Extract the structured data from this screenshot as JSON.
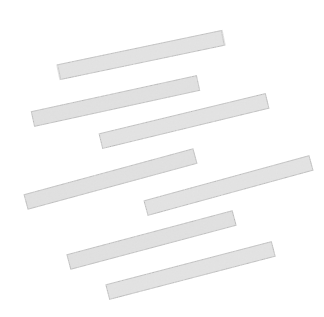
{
  "figure": {
    "title": "",
    "canvas": {
      "width": 324,
      "height": 317,
      "background": "#ffffff"
    },
    "style": {
      "fill_color": "#e9e9e9",
      "stroke_color": "#4a4a4a",
      "stroke_width": 1,
      "texture": "speckled-noise",
      "texture_color": "#b9b9b9",
      "shape_kind": "elongated-rectangle"
    },
    "object_count_label": "7",
    "bars": [
      {
        "id": "bar-1",
        "label": "1",
        "left_end": {
          "x": 59,
          "y": 72
        },
        "right_end": {
          "x": 223,
          "y": 38
        },
        "center": {
          "x": 141,
          "y": 55
        },
        "length": 168,
        "thickness": 15,
        "angle_deg": -11.8
      },
      {
        "id": "bar-2",
        "label": "2",
        "left_end": {
          "x": 33,
          "y": 119
        },
        "right_end": {
          "x": 198,
          "y": 83
        },
        "center": {
          "x": 115.5,
          "y": 101
        },
        "length": 169,
        "thickness": 15,
        "angle_deg": -12.3
      },
      {
        "id": "bar-3",
        "label": "3",
        "left_end": {
          "x": 101,
          "y": 141
        },
        "right_end": {
          "x": 267,
          "y": 101
        },
        "center": {
          "x": 184,
          "y": 121
        },
        "length": 171,
        "thickness": 15,
        "angle_deg": -13.6
      },
      {
        "id": "bar-4",
        "label": "4",
        "left_end": {
          "x": 26,
          "y": 202
        },
        "right_end": {
          "x": 195,
          "y": 156
        },
        "center": {
          "x": 110.5,
          "y": 179
        },
        "length": 175,
        "thickness": 15,
        "angle_deg": -15.2
      },
      {
        "id": "bar-5",
        "label": "5",
        "left_end": {
          "x": 146,
          "y": 208
        },
        "right_end": {
          "x": 311,
          "y": 163
        },
        "center": {
          "x": 228.5,
          "y": 185.5
        },
        "length": 171,
        "thickness": 15,
        "angle_deg": -15.3
      },
      {
        "id": "bar-6",
        "label": "6",
        "left_end": {
          "x": 69,
          "y": 262
        },
        "right_end": {
          "x": 234,
          "y": 218
        },
        "center": {
          "x": 151.5,
          "y": 240
        },
        "length": 171,
        "thickness": 15,
        "angle_deg": -14.9
      },
      {
        "id": "bar-7",
        "label": "7",
        "left_end": {
          "x": 108,
          "y": 292
        },
        "right_end": {
          "x": 273,
          "y": 249
        },
        "center": {
          "x": 190.5,
          "y": 270.5
        },
        "length": 171,
        "thickness": 15,
        "angle_deg": -14.6
      }
    ]
  }
}
